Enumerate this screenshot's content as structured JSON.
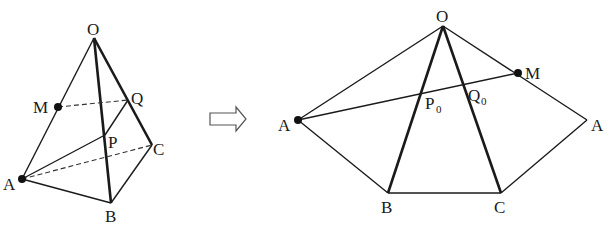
{
  "left_figure": {
    "description": "Tetrahedron O-ABC with points M on OA, P on OB, Q on OC",
    "labels": {
      "O": "O",
      "M": "M",
      "Q": "Q",
      "P": "P",
      "C": "C",
      "A": "A",
      "B": "B"
    }
  },
  "arrow": {
    "icon": "hollow-right-arrow-icon"
  },
  "right_figure": {
    "description": "Unfolded net of lateral faces A-O-B-C-A with segment AM crossing OB at P0 and OC at Q0",
    "labels": {
      "O": "O",
      "M": "M",
      "A_left": "A",
      "A_right": "A",
      "B": "B",
      "C": "C",
      "P0_main": "P",
      "P0_sub": "0",
      "Q0_main": "Q",
      "Q0_sub": "0"
    }
  },
  "colors": {
    "stroke": "#1a1a1a",
    "background": "#ffffff"
  }
}
